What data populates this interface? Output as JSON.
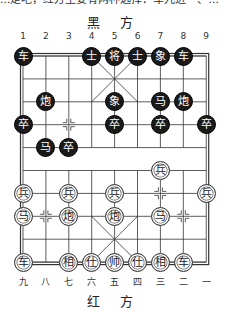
{
  "page_text": {
    "top_cut_line": "...走吧，红方主要有两种选择：车九进一、..."
  },
  "board": {
    "top_side_label": "黑 方",
    "bottom_side_label": "红 方",
    "top_file_numbers": [
      "1",
      "2",
      "3",
      "4",
      "5",
      "6",
      "7",
      "8",
      "9"
    ],
    "bottom_file_numbers": [
      "九",
      "八",
      "七",
      "六",
      "五",
      "四",
      "三",
      "二",
      "一"
    ],
    "colors": {
      "black_piece": "#1a1a1a",
      "red_piece_bg": "#ffffff",
      "line": "#333333"
    },
    "pieces": [
      {
        "side": "black",
        "char": "车",
        "col": 1,
        "row": 0
      },
      {
        "side": "black",
        "char": "士",
        "col": 4,
        "row": 0
      },
      {
        "side": "black",
        "char": "将",
        "col": 5,
        "row": 0
      },
      {
        "side": "black",
        "char": "士",
        "col": 6,
        "row": 0
      },
      {
        "side": "black",
        "char": "象",
        "col": 7,
        "row": 0
      },
      {
        "side": "black",
        "char": "车",
        "col": 8,
        "row": 0
      },
      {
        "side": "black",
        "char": "炮",
        "col": 2,
        "row": 2
      },
      {
        "side": "black",
        "char": "象",
        "col": 5,
        "row": 2
      },
      {
        "side": "black",
        "char": "马",
        "col": 7,
        "row": 2
      },
      {
        "side": "black",
        "char": "炮",
        "col": 8,
        "row": 2
      },
      {
        "side": "black",
        "char": "卒",
        "col": 1,
        "row": 3
      },
      {
        "side": "black",
        "char": "卒",
        "col": 5,
        "row": 3
      },
      {
        "side": "black",
        "char": "卒",
        "col": 7,
        "row": 3
      },
      {
        "side": "black",
        "char": "卒",
        "col": 9,
        "row": 3
      },
      {
        "side": "black",
        "char": "马",
        "col": 2,
        "row": 4
      },
      {
        "side": "black",
        "char": "卒",
        "col": 3,
        "row": 4
      },
      {
        "side": "red",
        "char": "兵",
        "col": 7,
        "row": 5
      },
      {
        "side": "red",
        "char": "兵",
        "col": 1,
        "row": 6
      },
      {
        "side": "red",
        "char": "兵",
        "col": 3,
        "row": 6
      },
      {
        "side": "red",
        "char": "兵",
        "col": 5,
        "row": 6
      },
      {
        "side": "red",
        "char": "兵",
        "col": 9,
        "row": 6
      },
      {
        "side": "red",
        "char": "马",
        "col": 1,
        "row": 7
      },
      {
        "side": "red",
        "char": "炮",
        "col": 3,
        "row": 7
      },
      {
        "side": "red",
        "char": "炮",
        "col": 5,
        "row": 7
      },
      {
        "side": "red",
        "char": "马",
        "col": 7,
        "row": 7
      },
      {
        "side": "red",
        "char": "车",
        "col": 1,
        "row": 9
      },
      {
        "side": "red",
        "char": "相",
        "col": 3,
        "row": 9
      },
      {
        "side": "red",
        "char": "仕",
        "col": 4,
        "row": 9
      },
      {
        "side": "red",
        "char": "帅",
        "col": 5,
        "row": 9
      },
      {
        "side": "red",
        "char": "仕",
        "col": 6,
        "row": 9
      },
      {
        "side": "red",
        "char": "相",
        "col": 7,
        "row": 9
      },
      {
        "side": "red",
        "char": "车",
        "col": 8,
        "row": 9
      }
    ],
    "position_markers": [
      {
        "col": 3,
        "row": 3
      },
      {
        "col": 7,
        "row": 6
      },
      {
        "col": 2,
        "row": 7
      },
      {
        "col": 8,
        "row": 7
      }
    ]
  }
}
